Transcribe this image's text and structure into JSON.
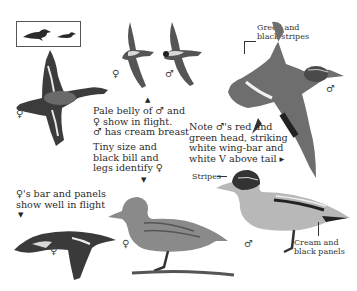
{
  "page": {
    "size_comparison": {
      "label": "size-comparison-silhouettes"
    },
    "captions": {
      "green_black_stripes": [
        "Green and",
        "black stripes"
      ],
      "pale_belly": [
        "Pale belly of ♂ and",
        "♀ show in flight.",
        "♂ has cream breast"
      ],
      "tiny_size": [
        "Tiny size and",
        "black bill and",
        "legs identify ♀"
      ],
      "note_male": [
        "Note ♂'s red and",
        "green head, striking",
        "white wing-bar and",
        "white V above tail ▸"
      ],
      "female_bar": [
        "♀'s bar and panels",
        "show well in flight"
      ],
      "stripes": "Stripes",
      "cream_black": [
        "Cream and",
        "black panels"
      ]
    },
    "sex_symbols": {
      "female": "♀",
      "male": "♂"
    },
    "pointers": {
      "up": "▲",
      "down": "▼"
    },
    "colors": {
      "background": "#ffffff",
      "ink": "#2a2a2a",
      "bird_dark": "#3a3a3a",
      "bird_mid": "#7a7a7a",
      "bird_light": "#c8c8c8"
    }
  }
}
